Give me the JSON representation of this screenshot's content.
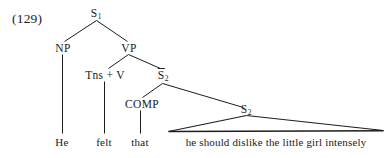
{
  "figure": {
    "example_number": "(129)",
    "type": "phrase-structure-tree",
    "sentence": "He felt that he should dislike the little girl intensely"
  },
  "nodes": {
    "s1": {
      "label": "S",
      "subscript": "1",
      "overbar": false
    },
    "np": {
      "label": "NP",
      "subscript": "",
      "overbar": false
    },
    "vp": {
      "label": "VP",
      "subscript": "",
      "overbar": false
    },
    "tns_v": {
      "label": "Tns + V",
      "subscript": "",
      "overbar": false
    },
    "sbar2": {
      "label": "S",
      "subscript": "2",
      "overbar": true
    },
    "comp": {
      "label": "COMP",
      "subscript": "",
      "overbar": false
    },
    "s2": {
      "label": "S",
      "subscript": "2",
      "overbar": false
    }
  },
  "terminals": {
    "he": "He",
    "felt": "felt",
    "that": "that",
    "embedded_clause": "he should dislike the little girl intensely"
  },
  "colors": {
    "ink": "#1d1d1d",
    "background": "#ffffff"
  }
}
